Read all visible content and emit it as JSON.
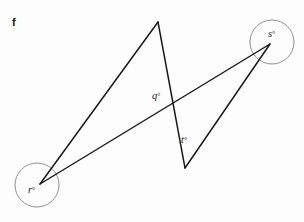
{
  "figure": {
    "label": "f",
    "background_color": "#fdfdfd",
    "line_color": "#161616",
    "circle_color": "#8f8f8f",
    "label_color": "#181818",
    "width": 304,
    "height": 222
  },
  "vertices": {
    "r": {
      "name": "r",
      "x": 40,
      "y": 184
    },
    "s": {
      "name": "s",
      "x": 270,
      "y": 44
    },
    "apex": {
      "name": "top-apex",
      "x": 158,
      "y": 22
    },
    "vee": {
      "name": "bottom-vee",
      "x": 185,
      "y": 168
    },
    "crossing": {
      "name": "line-crossing",
      "x": 172,
      "y": 101
    }
  },
  "segments": [
    {
      "name": "r-to-apex",
      "from": "r",
      "to": "apex"
    },
    {
      "name": "apex-to-vee",
      "from": "apex",
      "to": "vee"
    },
    {
      "name": "r-to-s",
      "from": "r",
      "to": "s"
    },
    {
      "name": "vee-to-s",
      "from": "vee",
      "to": "s"
    }
  ],
  "highlight_circles": [
    {
      "name": "angle-circle-r",
      "cx": 37,
      "cy": 185,
      "r": 22
    },
    {
      "name": "angle-circle-s",
      "cx": 272,
      "cy": 42,
      "r": 22
    }
  ],
  "angle_labels": [
    {
      "key": "r",
      "letter": "r",
      "degree": "°",
      "x": 28,
      "y": 193
    },
    {
      "key": "s",
      "letter": "s",
      "degree": "°",
      "x": 268,
      "y": 37
    },
    {
      "key": "q",
      "letter": "q",
      "degree": "°",
      "x": 152,
      "y": 99
    },
    {
      "key": "t",
      "letter": "t",
      "degree": "°",
      "x": 181,
      "y": 143
    }
  ],
  "figure_label": {
    "text": "f",
    "x": 12,
    "y": 26
  }
}
